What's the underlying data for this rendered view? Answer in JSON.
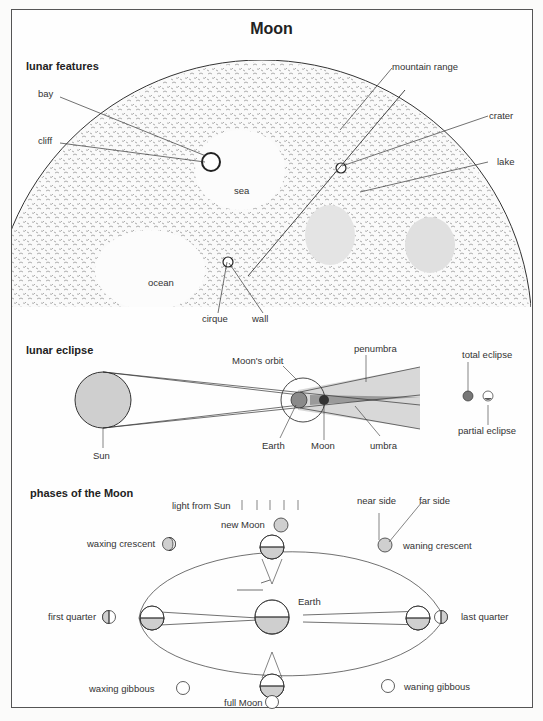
{
  "title": "Moon",
  "sections": {
    "features": {
      "heading": "lunar features",
      "labels": {
        "bay": "bay",
        "cliff": "cliff",
        "sea": "sea",
        "ocean": "ocean",
        "cirque": "cirque",
        "wall": "wall",
        "mountain_range": "mountain range",
        "crater": "crater",
        "lake": "lake"
      }
    },
    "eclipse": {
      "heading": "lunar eclipse",
      "labels": {
        "sun": "Sun",
        "moons_orbit": "Moon's orbit",
        "earth": "Earth",
        "moon": "Moon",
        "penumbra": "penumbra",
        "umbra": "umbra",
        "total_eclipse": "total eclipse",
        "partial_eclipse": "partial eclipse"
      }
    },
    "phases": {
      "heading": "phases of the Moon",
      "labels": {
        "light_from_sun": "light from Sun",
        "new_moon": "new Moon",
        "waxing_crescent": "waxing crescent",
        "first_quarter": "first quarter",
        "waxing_gibbous": "waxing gibbous",
        "full_moon": "full Moon",
        "waning_gibbous": "waning gibbous",
        "last_quarter": "last quarter",
        "waning_crescent": "waning crescent",
        "near_side": "near side",
        "far_side": "far side",
        "earth": "Earth"
      }
    }
  },
  "colors": {
    "shade": "#cfcfcf",
    "line": "#333333",
    "dark": "#555555"
  }
}
